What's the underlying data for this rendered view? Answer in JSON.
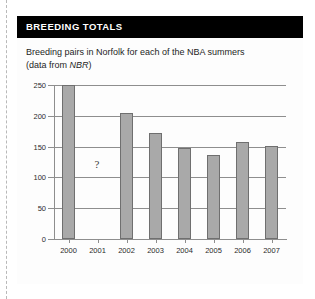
{
  "panel": {
    "header_title": "BREEDING TOTALS",
    "caption_line1": "Breeding pairs in Norfolk for each of the NBA summers",
    "caption_line2_prefix": "(data from ",
    "caption_source": "NBR",
    "caption_line2_suffix": ")"
  },
  "chart_data": {
    "type": "bar",
    "title": "Breeding pairs in Norfolk for each of the NBA summers",
    "subtitle": "(data from NBR)",
    "xlabel": "",
    "ylabel": "",
    "categories": [
      "2000",
      "2001",
      "2002",
      "2003",
      "2004",
      "2005",
      "2006",
      "2007"
    ],
    "values": [
      250,
      null,
      205,
      172,
      147,
      137,
      157,
      151
    ],
    "missing_label": "?",
    "missing_category": "2001",
    "ylim": [
      0,
      250
    ],
    "yticks": [
      0,
      50,
      100,
      150,
      200,
      250
    ],
    "ytick_labels": [
      "0",
      "50",
      "100",
      "150",
      "200",
      "250"
    ],
    "grid": true,
    "legend": false,
    "bar_color": "#a9a9a9",
    "bar_border_color": "#6f6f6f",
    "axis_color": "#8e8e8e"
  },
  "colors": {
    "header_bg": "#000000",
    "header_text": "#ffffff",
    "panel_bg": "#fdfdfd",
    "fold_line": "#b9b9b9"
  }
}
